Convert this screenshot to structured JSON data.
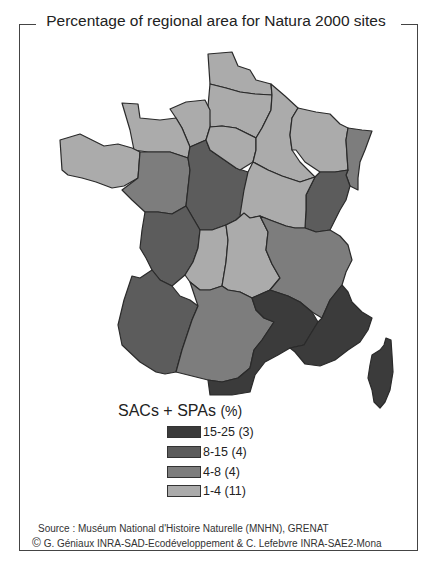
{
  "title": "Percentage of regional area for Natura 2000 sites",
  "legend": {
    "title": "SACs + SPAs",
    "unit": "(%)",
    "classes": [
      {
        "label": "15-25 (3)",
        "range": "15-25",
        "count": 3,
        "color": "#3b3b3b"
      },
      {
        "label": "8-15 (4)",
        "range": "8-15",
        "count": 4,
        "color": "#5c5c5c"
      },
      {
        "label": "4-8 (4)",
        "range": "4-8",
        "count": 4,
        "color": "#7d7d7d"
      },
      {
        "label": "1-4 (11)",
        "range": "1-4",
        "count": 11,
        "color": "#ababab"
      }
    ]
  },
  "regions": [
    {
      "name": "Nord-Pas-de-Calais",
      "class": 3
    },
    {
      "name": "Picardie",
      "class": 3
    },
    {
      "name": "Haute-Normandie",
      "class": 3
    },
    {
      "name": "Basse-Normandie",
      "class": 3
    },
    {
      "name": "Bretagne",
      "class": 3
    },
    {
      "name": "Pays de la Loire",
      "class": 2
    },
    {
      "name": "Centre",
      "class": 1
    },
    {
      "name": "Ile-de-France",
      "class": 3
    },
    {
      "name": "Champagne-Ardenne",
      "class": 3
    },
    {
      "name": "Lorraine",
      "class": 3
    },
    {
      "name": "Alsace",
      "class": 2
    },
    {
      "name": "Franche-Comte",
      "class": 1
    },
    {
      "name": "Bourgogne",
      "class": 3
    },
    {
      "name": "Poitou-Charentes",
      "class": 1
    },
    {
      "name": "Limousin",
      "class": 3
    },
    {
      "name": "Auvergne",
      "class": 3
    },
    {
      "name": "Rhone-Alpes",
      "class": 2
    },
    {
      "name": "Aquitaine",
      "class": 1
    },
    {
      "name": "Midi-Pyrenees",
      "class": 2
    },
    {
      "name": "Languedoc-Roussillon",
      "class": 0
    },
    {
      "name": "Provence-Alpes-Cote d'Azur",
      "class": 0
    },
    {
      "name": "Corse",
      "class": 0
    }
  ],
  "source": {
    "line1": "Source : Muséum National d'Histoire Naturelle (MNHN),  GRENAT",
    "line2": "G. Géniaux INRA-SAD-Ecodéveloppement & C. Lefebvre INRA-SAE2-Mona",
    "copyright_symbol": "©"
  }
}
